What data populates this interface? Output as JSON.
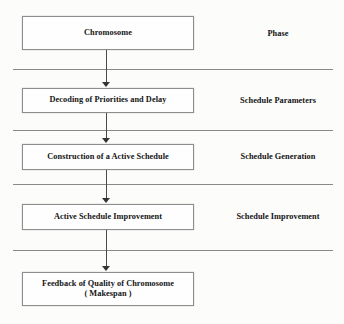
{
  "diagram": {
    "background_color": "#fcfcfb",
    "box_border_color": "#8d8d8d",
    "rule_color": "#6f6f6f",
    "arrow_color": "#333333",
    "nodes": [
      {
        "id": "chromosome",
        "lines": [
          "Chromosome"
        ]
      },
      {
        "id": "decoding",
        "lines": [
          "Decoding of Priorities and Delay"
        ]
      },
      {
        "id": "construction",
        "lines": [
          "Construction of a Active Schedule"
        ]
      },
      {
        "id": "improvement",
        "lines": [
          "Active Schedule Improvement"
        ]
      },
      {
        "id": "feedback",
        "lines": [
          "Feedback of Quality of Chromosome",
          "( Makespan )"
        ]
      }
    ],
    "phase_labels": [
      {
        "id": "phase",
        "label": "Phase"
      },
      {
        "id": "schedule-parameters",
        "label": "Schedule Parameters"
      },
      {
        "id": "schedule-generation",
        "label": "Schedule Generation"
      },
      {
        "id": "schedule-improvement",
        "label": "Schedule Improvement"
      }
    ],
    "connectors": [
      {
        "from": "chromosome",
        "to": "decoding"
      },
      {
        "from": "decoding",
        "to": "construction"
      },
      {
        "from": "construction",
        "to": "improvement"
      },
      {
        "from": "improvement",
        "to": "feedback"
      }
    ],
    "separators": 4
  }
}
